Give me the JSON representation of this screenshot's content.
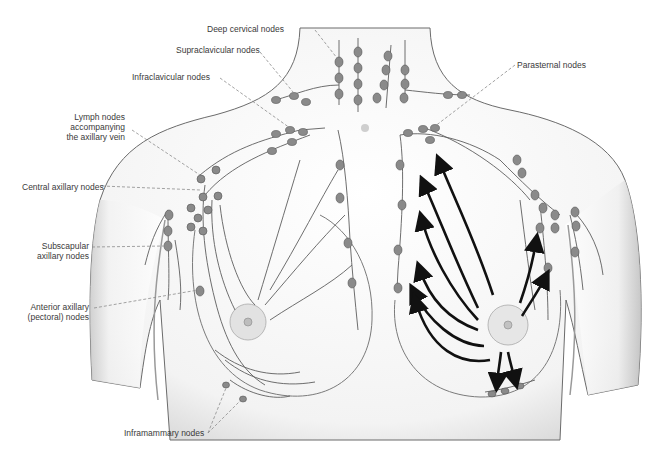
{
  "figure": {
    "colors": {
      "skin_outline": "#6b6b6b",
      "shading": "#cfcfcf",
      "node_fill": "#8a8a8a",
      "vessel": "#5e5e5e",
      "arrow": "#111111",
      "leader": "#8c8c8c",
      "label_text": "#3a3a3a"
    }
  },
  "labels": {
    "deep_cervical": "Deep cervical nodes",
    "supraclavicular": "Supraclavicular nodes",
    "infraclavicular": "Infraclavicular nodes",
    "axillary_vein": "Lymph nodes\naccompanying\nthe axillary vein",
    "central_axillary": "Central axillary nodes",
    "subscapular": "Subscapular\naxillary nodes",
    "anterior_axillary": "Anterior axillary\n(pectoral) nodes",
    "inframammary": "Inframammary nodes",
    "parasternal": "Parasternal nodes"
  }
}
